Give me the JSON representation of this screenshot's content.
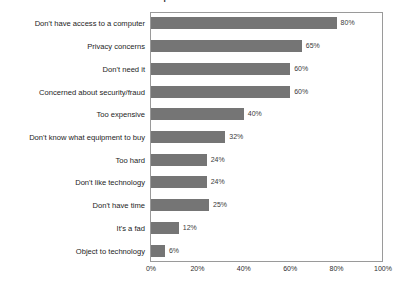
{
  "chart_data": {
    "type": "bar",
    "orientation": "horizontal",
    "title": "Reasons People Don't Use The Web At Home",
    "xlabel": "",
    "ylabel": "",
    "xlim": [
      0,
      100
    ],
    "xticks": [
      "0%",
      "20%",
      "40%",
      "60%",
      "80%",
      "100%"
    ],
    "xtick_values": [
      0,
      20,
      40,
      60,
      80,
      100
    ],
    "grid": false,
    "legend": false,
    "bar_color": "#757575",
    "frame_color": "#9a9a9a",
    "categories": [
      "Don't have access to a computer",
      "Privacy concerns",
      "Don't need it",
      "Concerned about security/fraud",
      "Too expensive",
      "Don't know what equipment to buy",
      "Too hard",
      "Don't like technology",
      "Don't have time",
      "It's a fad",
      "Object to technology"
    ],
    "values": [
      80,
      65,
      60,
      60,
      40,
      32,
      24,
      24,
      25,
      12,
      6
    ],
    "value_labels": [
      "80%",
      "65%",
      "60%",
      "60%",
      "40%",
      "32%",
      "24%",
      "24%",
      "25%",
      "12%",
      "6%"
    ]
  }
}
